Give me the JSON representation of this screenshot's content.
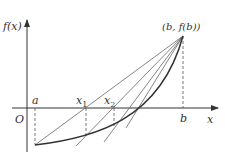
{
  "diagram": {
    "type": "secant-method-convergence",
    "labels": {
      "y_axis": "f(x)",
      "x_axis": "x",
      "origin": "O",
      "a": "a",
      "b": "b",
      "x1": "x",
      "x1_sub": "1",
      "x2": "x",
      "x2_sub": "2",
      "endpoint": "(b, f(b))"
    },
    "colors": {
      "axis": "#333333",
      "curve": "#333333",
      "secant": "#666666",
      "dashed": "#555555"
    }
  }
}
